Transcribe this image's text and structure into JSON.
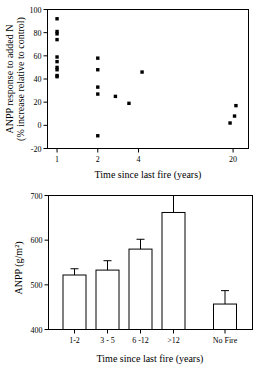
{
  "chart_data": [
    {
      "type": "scatter",
      "panel": "top",
      "title": "",
      "xlabel": "Time since last fire (years)",
      "ylabel_line1": "ANPP response to added N",
      "ylabel_line2": "(% increase relative to control)",
      "xscale": "log",
      "xlim": [
        0.85,
        26
      ],
      "ylim": [
        -20,
        100
      ],
      "xticks": [
        1,
        2,
        4,
        20
      ],
      "xticklabels": [
        "1",
        "2",
        "4",
        "20"
      ],
      "yticks": [
        -20,
        0,
        20,
        40,
        60,
        80,
        100
      ],
      "yticklabels": [
        "-20",
        "0",
        "20",
        "40",
        "60",
        "80",
        "100"
      ],
      "grid": false,
      "legend": "none",
      "marker": "filled-square",
      "points": [
        {
          "x": 1.0,
          "y": 92
        },
        {
          "x": 1.0,
          "y": 81
        },
        {
          "x": 1.0,
          "y": 79
        },
        {
          "x": 1.0,
          "y": 74
        },
        {
          "x": 1.0,
          "y": 59
        },
        {
          "x": 1.0,
          "y": 55
        },
        {
          "x": 1.0,
          "y": 50
        },
        {
          "x": 1.0,
          "y": 48
        },
        {
          "x": 1.0,
          "y": 43
        },
        {
          "x": 1.0,
          "y": 42
        },
        {
          "x": 2.0,
          "y": 58
        },
        {
          "x": 2.0,
          "y": 48
        },
        {
          "x": 2.0,
          "y": 33
        },
        {
          "x": 2.0,
          "y": 27
        },
        {
          "x": 2.0,
          "y": -9
        },
        {
          "x": 2.7,
          "y": 25
        },
        {
          "x": 3.4,
          "y": 19
        },
        {
          "x": 4.25,
          "y": 46
        },
        {
          "x": 21.0,
          "y": 17
        },
        {
          "x": 20.5,
          "y": 8
        },
        {
          "x": 19.0,
          "y": 2
        }
      ]
    },
    {
      "type": "bar",
      "panel": "bottom",
      "title": "",
      "xlabel": "Time since last fire (years)",
      "ylabel": "ANPP (g/m²)",
      "categories": [
        "1-2",
        "3 - 5",
        "6 -12",
        ">12",
        "No Fire"
      ],
      "values": [
        522,
        533,
        580,
        662,
        457
      ],
      "errors": [
        14,
        21,
        22,
        38,
        30
      ],
      "ylim": [
        400,
        700
      ],
      "yticks": [
        400,
        500,
        600,
        700
      ],
      "yticklabels": [
        "400",
        "500",
        "600",
        "700"
      ],
      "grid": false,
      "legend": "none",
      "gap_before_last": true
    }
  ]
}
